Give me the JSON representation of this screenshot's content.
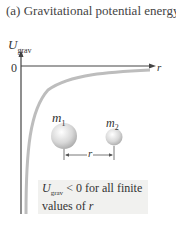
{
  "title": "(a) Gravitational potential energy",
  "axes": {
    "y_label_main": "U",
    "y_label_sub": "grav",
    "zero_label": "0",
    "x_label": "r"
  },
  "masses": {
    "m1_main": "m",
    "m1_sub": "1",
    "m2_main": "m",
    "m2_sub": "2",
    "separation_label": "r"
  },
  "note": {
    "u_main": "U",
    "u_sub": "grav",
    "line1_rest": " < 0 for all finite",
    "line2_prefix": "values of ",
    "line2_var": "r"
  },
  "colors": {
    "curve": "#bdbdbd",
    "axis": "#444444",
    "note_bg": "#f1f1ef"
  }
}
